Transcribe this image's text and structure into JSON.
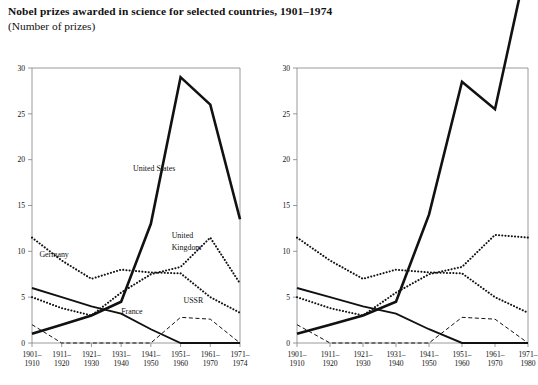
{
  "header": {
    "title": "Nobel prizes awarded in science for selected countries, 1901–1974",
    "subtitle": "(Number of prizes)"
  },
  "chart_data": [
    {
      "type": "line",
      "panel": "left",
      "title": "Nobel prizes awarded in science for selected countries, 1901–1974",
      "subtitle": "(Number of prizes)",
      "xlabel": "",
      "ylabel": "Number of prizes",
      "ylim": [
        0,
        30
      ],
      "yticks": [
        0,
        5,
        10,
        15,
        20,
        25,
        30
      ],
      "grid": false,
      "legend": "inline-annotations",
      "categories": [
        "1901–1910",
        "1911–1920",
        "1921–1930",
        "1931–1940",
        "1941–1950",
        "1951–1960",
        "1961–1970",
        "1971–1974"
      ],
      "series": [
        {
          "name": "United States",
          "style": "solid-thick",
          "values": [
            1,
            2,
            3,
            4.5,
            13,
            29,
            26,
            13.5
          ]
        },
        {
          "name": "Germany",
          "style": "dotted",
          "values": [
            11.5,
            9,
            7,
            8,
            7.7,
            7.6,
            5,
            3.3
          ]
        },
        {
          "name": "United Kingdom",
          "style": "dotted",
          "values": [
            5,
            3.8,
            3,
            5.5,
            7.5,
            8.3,
            11.5,
            6.5
          ]
        },
        {
          "name": "France",
          "style": "solid-medium",
          "values": [
            6,
            5,
            4,
            3.2,
            1.5,
            0,
            0,
            0
          ]
        },
        {
          "name": "USSR",
          "style": "dashed",
          "values": [
            2,
            0,
            0,
            0,
            0,
            2.8,
            2.6,
            0
          ]
        }
      ],
      "annotations": [
        {
          "text": "United States",
          "x_index": 3.4,
          "y_value": 18.8
        },
        {
          "text": "United",
          "x_index": 4.7,
          "y_value": 11.5
        },
        {
          "text": "Kingdom",
          "x_index": 4.7,
          "y_value": 10.2
        },
        {
          "text": "Germany",
          "x_index": 0.25,
          "y_value": 9.4
        },
        {
          "text": "France",
          "x_index": 3.0,
          "y_value": 3.2
        },
        {
          "text": "USSR",
          "x_index": 5.1,
          "y_value": 4.4
        }
      ]
    },
    {
      "type": "line",
      "panel": "right",
      "xlabel": "",
      "ylabel": "Number of prizes",
      "ylim": [
        0,
        30
      ],
      "yticks": [
        0,
        5,
        10,
        15,
        20,
        25,
        30
      ],
      "grid": false,
      "legend": "none",
      "categories": [
        "1901–1910",
        "1911–1920",
        "1921–1930",
        "1931–1940",
        "1941–1950",
        "1951–1960",
        "1961–1970",
        "1971–1980"
      ],
      "series": [
        {
          "name": "United States",
          "style": "solid-thick",
          "values": [
            1,
            2,
            3,
            4.5,
            14,
            28.5,
            25.5,
            42
          ]
        },
        {
          "name": "Germany",
          "style": "dotted",
          "values": [
            11.5,
            9,
            7,
            8,
            7.7,
            7.6,
            5,
            3.3
          ]
        },
        {
          "name": "United Kingdom",
          "style": "dotted",
          "values": [
            5,
            3.8,
            3,
            5.5,
            7.5,
            8.3,
            11.8,
            11.5
          ]
        },
        {
          "name": "France",
          "style": "solid-medium",
          "values": [
            6,
            5,
            4,
            3.2,
            1.5,
            0,
            0,
            0
          ]
        },
        {
          "name": "USSR",
          "style": "dashed",
          "values": [
            2,
            0,
            0,
            0,
            0,
            2.8,
            2.6,
            0
          ]
        }
      ],
      "annotations": []
    }
  ],
  "colors": {
    "ink": "#111111",
    "axis": "#808080",
    "background": "#ffffff"
  }
}
